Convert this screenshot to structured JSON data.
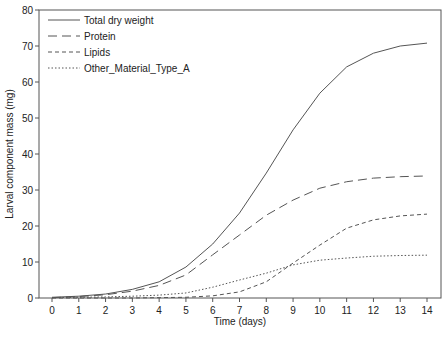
{
  "chart_data": {
    "type": "line",
    "title": "",
    "xlabel": "Time  (days)",
    "ylabel": "Larval component mass (mg)",
    "xlim": [
      0,
      14
    ],
    "ylim": [
      0,
      80
    ],
    "x_ticks": [
      0,
      1,
      2,
      3,
      4,
      5,
      6,
      7,
      8,
      9,
      10,
      11,
      12,
      13,
      14
    ],
    "y_ticks": [
      0,
      10,
      20,
      30,
      40,
      50,
      60,
      70,
      80
    ],
    "grid": false,
    "legend_position": "upper-left",
    "x": [
      0,
      1,
      2,
      3,
      4,
      5,
      6,
      7,
      8,
      9,
      10,
      11,
      12,
      13,
      14
    ],
    "series": [
      {
        "name": "Total dry weight",
        "style": "solid",
        "values": [
          0.2,
          0.5,
          1.1,
          2.4,
          4.5,
          8.6,
          15.0,
          23.6,
          34.7,
          46.7,
          56.9,
          64.2,
          68.0,
          70.0,
          70.8
        ]
      },
      {
        "name": "Protein",
        "style": "long-dash",
        "values": [
          0.1,
          0.4,
          0.9,
          1.9,
          3.5,
          6.4,
          12.0,
          17.5,
          23.0,
          27.2,
          30.5,
          32.3,
          33.3,
          33.7,
          33.9
        ]
      },
      {
        "name": "Lipids",
        "style": "short-dash",
        "values": [
          0.0,
          0.0,
          0.0,
          0.0,
          0.1,
          0.2,
          0.6,
          1.7,
          4.5,
          9.7,
          14.7,
          19.4,
          21.7,
          22.8,
          23.3
        ]
      },
      {
        "name": "Other_Material_Type_A",
        "style": "dotted",
        "values": [
          0.1,
          0.2,
          0.3,
          0.5,
          0.8,
          1.4,
          3.0,
          5.0,
          6.9,
          9.2,
          10.5,
          11.1,
          11.6,
          11.8,
          11.9
        ]
      }
    ]
  }
}
